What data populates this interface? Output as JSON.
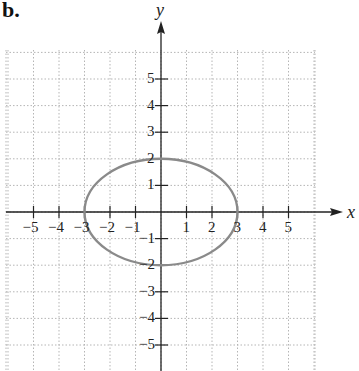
{
  "panel_label": "b.",
  "chart_data": {
    "type": "line",
    "title": "",
    "xlabel": "x",
    "ylabel": "y",
    "xlim": [
      -6,
      6
    ],
    "ylim": [
      -6,
      6
    ],
    "grid": true,
    "grid_style": "dotted",
    "x_ticks": [
      -5,
      -4,
      -3,
      -2,
      -1,
      1,
      2,
      3,
      4,
      5
    ],
    "y_ticks": [
      -5,
      -4,
      -3,
      -2,
      -1,
      1,
      2,
      3,
      4,
      5
    ],
    "x_tick_labels": [
      "−5",
      "−4",
      "−3",
      "−2",
      "−1",
      "1",
      "2",
      "3",
      "4",
      "5"
    ],
    "y_tick_labels": [
      "−5",
      "−4",
      "−3",
      "−2",
      "−1",
      "1",
      "2",
      "3",
      "4",
      "5"
    ],
    "series": [
      {
        "name": "ellipse",
        "shape": "ellipse",
        "equation": "x^2/9 + y^2/4 = 1",
        "center": [
          0,
          0
        ],
        "semi_major_x": 3,
        "semi_minor_y": 2,
        "vertices": [
          [
            -3,
            0
          ],
          [
            3,
            0
          ],
          [
            0,
            2
          ],
          [
            0,
            -2
          ]
        ],
        "color": "#8a8a8a"
      }
    ]
  },
  "colors": {
    "axis": "#222222",
    "grid": "#b5b5b5",
    "curve": "#8a8a8a"
  }
}
